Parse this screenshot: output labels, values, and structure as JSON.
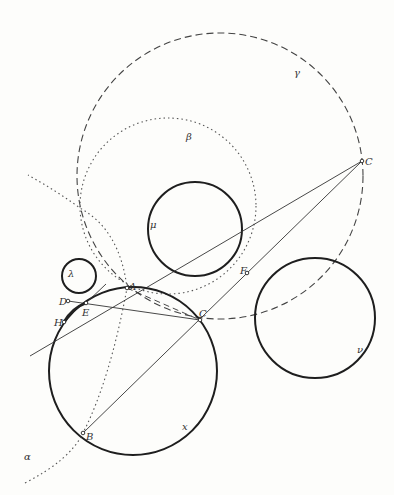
{
  "diagram": {
    "type": "geometric-construction",
    "circles": [
      {
        "name": "gamma",
        "label": "γ",
        "style": "dashed",
        "cx": 220,
        "cy": 176,
        "r": 143,
        "label_x": 294,
        "label_y": 76
      },
      {
        "name": "beta",
        "label": "β",
        "style": "dotted",
        "cx": 168,
        "cy": 206,
        "r": 88,
        "label_x": 186,
        "label_y": 140
      },
      {
        "name": "mu",
        "label": "μ",
        "style": "solid",
        "cx": 195,
        "cy": 229,
        "r": 47,
        "label_x": 150,
        "label_y": 228
      },
      {
        "name": "lambda",
        "label": "λ",
        "style": "solid",
        "cx": 79,
        "cy": 276,
        "r": 17,
        "label_x": 68,
        "label_y": 277
      },
      {
        "name": "kappa",
        "label": "x",
        "style": "solid",
        "cx": 133,
        "cy": 371,
        "r": 84,
        "label_x": 182,
        "label_y": 430
      },
      {
        "name": "nu",
        "label": "ν",
        "style": "solid",
        "cx": 315,
        "cy": 318,
        "r": 60,
        "label_x": 357,
        "label_y": 353
      }
    ],
    "points": [
      {
        "label": "C",
        "x": 362,
        "y": 161,
        "lx": 365,
        "ly": 165
      },
      {
        "label": "A",
        "x": 127,
        "y": 288,
        "lx": 129,
        "ly": 290
      },
      {
        "label": "C",
        "x": 200,
        "y": 320,
        "lx": 199,
        "ly": 317
      },
      {
        "label": "F",
        "x": 247,
        "y": 273,
        "lx": 240,
        "ly": 274
      },
      {
        "label": "D",
        "x": 68,
        "y": 301,
        "lx": 59,
        "ly": 305
      },
      {
        "label": "E",
        "x": 86,
        "y": 303,
        "lx": 82,
        "ly": 316
      },
      {
        "label": "H",
        "x": 64,
        "y": 322,
        "lx": 54,
        "ly": 326
      },
      {
        "label": "B",
        "x": 83,
        "y": 433,
        "lx": 86,
        "ly": 440
      }
    ],
    "curve_label": {
      "label": "α",
      "x": 24,
      "y": 460
    }
  }
}
